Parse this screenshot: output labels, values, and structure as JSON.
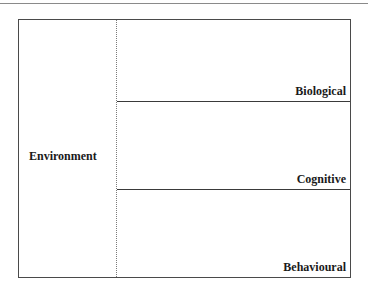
{
  "diagram": {
    "left_panel": {
      "label": "Environment"
    },
    "layers": [
      {
        "label": "Biological"
      },
      {
        "label": "Cognitive"
      },
      {
        "label": "Behavioural"
      }
    ]
  }
}
